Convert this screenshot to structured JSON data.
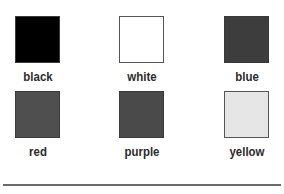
{
  "swatches": [
    {
      "label": "black",
      "color": "#000000"
    },
    {
      "label": "white",
      "color": "#ffffff"
    },
    {
      "label": "blue",
      "color": "#3d3d3d"
    },
    {
      "label": "red",
      "color": "#4f4f4f"
    },
    {
      "label": "purple",
      "color": "#4a4a4a"
    },
    {
      "label": "yellow",
      "color": "#e6e6e6"
    }
  ]
}
